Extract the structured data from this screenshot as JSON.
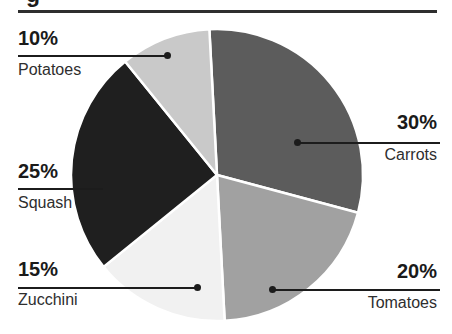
{
  "header": {
    "clipped_title_fragment": "g",
    "rule_color": "#2e2e2e"
  },
  "chart_data": {
    "type": "pie",
    "title": "",
    "categories": [
      "Carrots",
      "Tomatoes",
      "Zucchini",
      "Squash",
      "Potatoes"
    ],
    "values": [
      30,
      20,
      15,
      25,
      10
    ],
    "unit": "%",
    "start_angle_deg": -93,
    "direction": "clockwise",
    "legend_position": "callout-labels",
    "slice_gap_color": "#ffffff",
    "callout_line_color": "#1c1c1c",
    "slices": [
      {
        "label": "Carrots",
        "pct_label": "30%",
        "value": 30,
        "color": "#5c5c5c"
      },
      {
        "label": "Tomatoes",
        "pct_label": "20%",
        "value": 20,
        "color": "#a1a1a1"
      },
      {
        "label": "Zucchini",
        "pct_label": "15%",
        "value": 15,
        "color": "#f1f1f1"
      },
      {
        "label": "Squash",
        "pct_label": "25%",
        "value": 25,
        "color": "#1f1f1f"
      },
      {
        "label": "Potatoes",
        "pct_label": "10%",
        "value": 10,
        "color": "#c9c9c9"
      }
    ]
  }
}
